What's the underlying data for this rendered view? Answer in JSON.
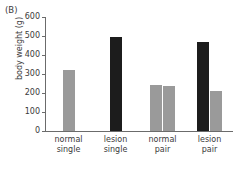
{
  "panel": {
    "label": "(B)"
  },
  "chart_data": {
    "type": "bar",
    "title": "",
    "panel_label": "(B)",
    "xlabel": "",
    "ylabel": "body weight (g)",
    "ylim": [
      0,
      600
    ],
    "ytick_values": [
      0,
      100,
      200,
      300,
      400,
      500,
      600
    ],
    "ytick_labels": [
      "0",
      "100",
      "200",
      "300",
      "400",
      "500",
      "600"
    ],
    "grid": false,
    "legend": null,
    "categories": [
      "normal single",
      "lesion single",
      "normal pair",
      "lesion pair"
    ],
    "category_lines": [
      [
        "normal",
        "single"
      ],
      [
        "lesion",
        "single"
      ],
      [
        "normal",
        "pair"
      ],
      [
        "lesion",
        "pair"
      ]
    ],
    "colors": {
      "gray": "#9a9a9a",
      "black": "#1c1c1c",
      "axis": "#6b6b6b",
      "text": "#3a3a3a",
      "background": "#ffffff"
    },
    "groups": [
      {
        "category": "normal single",
        "bars": [
          {
            "value": 320,
            "color": "gray"
          }
        ]
      },
      {
        "category": "lesion single",
        "bars": [
          {
            "value": 497,
            "color": "black"
          }
        ]
      },
      {
        "category": "normal pair",
        "bars": [
          {
            "value": 240,
            "color": "gray"
          },
          {
            "value": 235,
            "color": "gray"
          }
        ]
      },
      {
        "category": "lesion pair",
        "bars": [
          {
            "value": 467,
            "color": "black"
          },
          {
            "value": 208,
            "color": "gray"
          }
        ]
      }
    ]
  }
}
